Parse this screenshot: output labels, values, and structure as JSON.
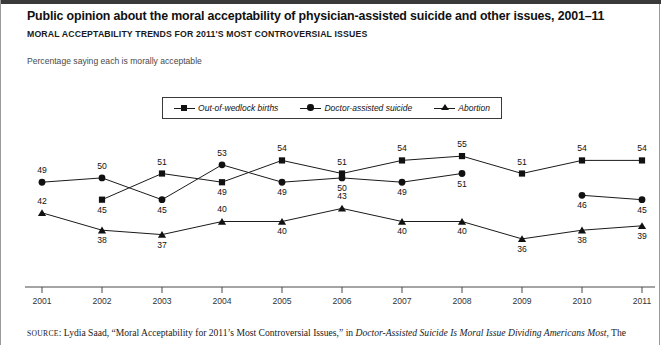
{
  "header": {
    "title": "Public opinion about the moral acceptability of physician-assisted suicide and other issues, 2001–11",
    "subtitle": "MORAL ACCEPTABILITY TRENDS FOR 2011'S MOST CONTROVERSIAL ISSUES",
    "blurb": "Percentage saying each is morally acceptable"
  },
  "source": {
    "label": "SOURCE",
    "colon": ": ",
    "text_before": "Lydia Saad, “Moral Acceptability for 2011’s Most Controversial Issues,” in ",
    "italic_title": "Doctor-Assisted Suicide Is Moral Issue Dividing Americans Most",
    "text_after": ", The"
  },
  "chart_data": {
    "type": "line",
    "title": "Public opinion about the moral acceptability of physician-assisted suicide and other issues, 2001–11",
    "subtitle": "MORAL ACCEPTABILITY TRENDS FOR 2011'S MOST CONTROVERSIAL ISSUES",
    "ylabel": "Percentage saying each is morally acceptable",
    "xlabel": "",
    "categories": [
      "2001",
      "2002",
      "2003",
      "2004",
      "2005",
      "2006",
      "2007",
      "2008",
      "2009",
      "2010",
      "2011"
    ],
    "ylim": [
      33,
      58
    ],
    "grid": false,
    "legend_position": "top-center",
    "series": [
      {
        "name": "Out-of-wedlock births",
        "marker": "square",
        "values": [
          null,
          45,
          51,
          49,
          54,
          51,
          54,
          55,
          51,
          54,
          54
        ]
      },
      {
        "name": "Doctor-assisted suicide",
        "marker": "circle",
        "values": [
          49,
          50,
          45,
          53,
          49,
          50,
          49,
          51,
          null,
          46,
          45
        ]
      },
      {
        "name": "Abortion",
        "marker": "triangle",
        "values": [
          42,
          38,
          37,
          40,
          40,
          43,
          40,
          40,
          36,
          38,
          39
        ]
      }
    ],
    "label_offsets": {
      "Out-of-wedlock births": [
        "",
        "below",
        "above",
        "below",
        "above",
        "above",
        "above",
        "above",
        "above",
        "above",
        "above"
      ],
      "Doctor-assisted suicide": [
        "above",
        "above",
        "below",
        "above",
        "below",
        "below",
        "below",
        "below",
        "",
        "below",
        "below"
      ],
      "Abortion": [
        "above",
        "below",
        "below",
        "above",
        "below",
        "above",
        "below",
        "below",
        "below",
        "below",
        "below"
      ]
    }
  }
}
